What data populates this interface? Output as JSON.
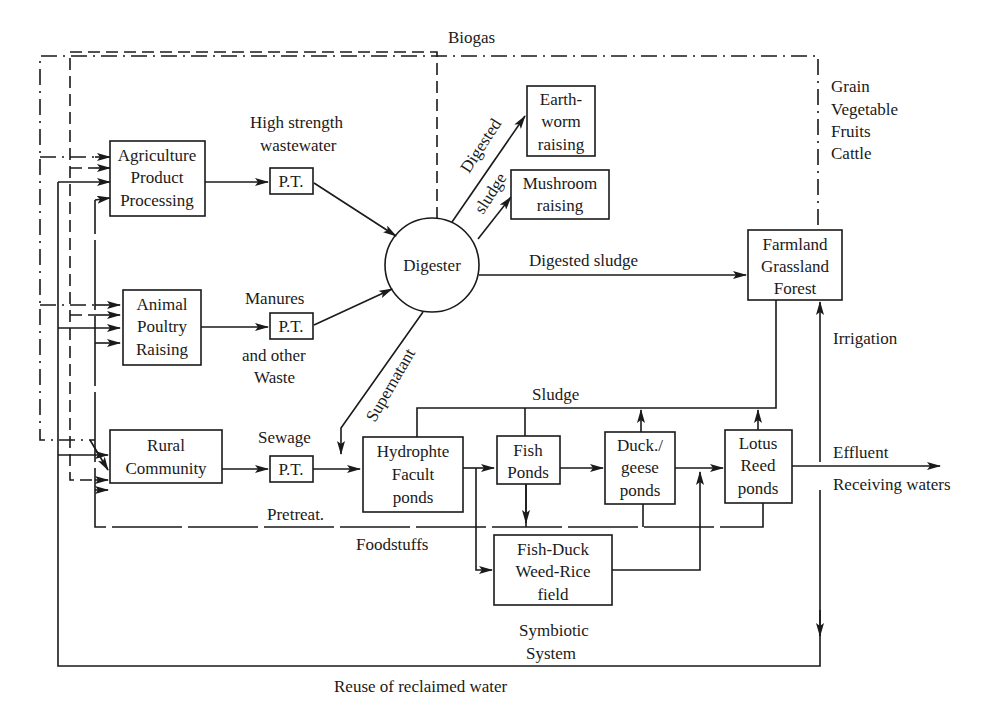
{
  "diagram": {
    "nodes": {
      "agri": {
        "lines": [
          "Agriculture",
          "Product",
          "Processing"
        ]
      },
      "animal": {
        "lines": [
          "Animal",
          "Poultry",
          "Raising"
        ]
      },
      "rural": {
        "lines": [
          "Rural",
          "Community"
        ]
      },
      "pt1": {
        "label": "P.T."
      },
      "pt2": {
        "label": "P.T."
      },
      "pt3": {
        "label": "P.T."
      },
      "digester": {
        "label": "Digester"
      },
      "earthworm": {
        "lines": [
          "Earth-",
          "worm",
          "raising"
        ]
      },
      "mushroom": {
        "lines": [
          "Mushroom",
          "raising"
        ]
      },
      "farmland": {
        "lines": [
          "Farmland",
          "Grassland",
          "Forest"
        ]
      },
      "hydrophte": {
        "lines": [
          "Hydrophte",
          "Facult",
          "ponds"
        ]
      },
      "fish": {
        "lines": [
          "Fish",
          "Ponds"
        ]
      },
      "duck": {
        "lines": [
          "Duck./",
          "geese",
          "ponds"
        ]
      },
      "lotus": {
        "lines": [
          "Lotus",
          "Reed",
          "ponds"
        ]
      },
      "fishduck": {
        "lines": [
          "Fish-Duck",
          "Weed-Rice",
          "field"
        ]
      }
    },
    "labels": {
      "biogas": "Biogas",
      "high_strength_1": "High strength",
      "high_strength_2": "wastewater",
      "manures": "Manures",
      "other_waste_1": "and other",
      "other_waste_2": "Waste",
      "sewage": "Sewage",
      "digested_1": "Digested",
      "digested_2": "sludge",
      "digested_sludge": "Digested sludge",
      "supernatant": "Supernatant",
      "sludge": "Sludge",
      "products_1": "Grain",
      "products_2": "Vegetable",
      "products_3": "Fruits",
      "products_4": "Cattle",
      "irrigation": "Irrigation",
      "effluent": "Effluent",
      "receiving": "Receiving waters",
      "pretreat": "Pretreat.",
      "foodstuffs": "Foodstuffs",
      "symbiotic_1": "Symbiotic",
      "symbiotic_2": "System",
      "reuse": "Reuse of reclaimed water"
    },
    "legend_line_styles": {
      "biogas": "dash",
      "products": "dash-dot",
      "foodstuffs": "broken solid",
      "water": "solid"
    }
  }
}
